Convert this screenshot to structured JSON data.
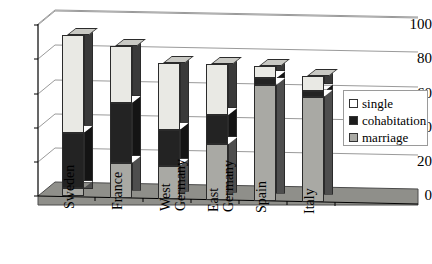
{
  "chart_data": {
    "type": "bar",
    "subtype": "stacked-column-3d",
    "title": "",
    "xlabel": "",
    "ylabel": "",
    "ylim": [
      0,
      100
    ],
    "yticks": [
      0,
      20,
      40,
      60,
      80,
      100
    ],
    "grid": true,
    "legend_position": "right",
    "categories": [
      "Sweden",
      "France",
      "West Germany",
      "East Germany",
      "Spain",
      "Italy"
    ],
    "series": [
      {
        "name": "marriage",
        "values": [
          5,
          20,
          19,
          32,
          67,
          61
        ]
      },
      {
        "name": "cohabitation",
        "values": [
          32,
          35,
          21,
          17,
          4,
          3
        ]
      },
      {
        "name": "single",
        "values": [
          57,
          33,
          39,
          30,
          7,
          9
        ]
      }
    ],
    "totals": [
      94,
      88,
      79,
      79,
      78,
      73
    ],
    "colors": {
      "single": "#e9e9e4",
      "cohabitation": "#232323",
      "marriage": "#a9a9a4",
      "axis": "#000000",
      "grid": "#9a9a9a",
      "floor": "#8f8f8a"
    }
  },
  "axis": {
    "y_ticks": [
      "100",
      "80",
      "60",
      "40",
      "20",
      "0"
    ]
  },
  "categories": [
    {
      "label": "Sweden",
      "lines": [
        "Sweden"
      ]
    },
    {
      "label": "France",
      "lines": [
        "France"
      ]
    },
    {
      "label": "West Germany",
      "lines": [
        "West",
        "Germany"
      ]
    },
    {
      "label": "East Germany",
      "lines": [
        "East",
        "Germany"
      ]
    },
    {
      "label": "Spain",
      "lines": [
        "Spain"
      ]
    },
    {
      "label": "Italy",
      "lines": [
        "Italy"
      ]
    }
  ],
  "legend": {
    "items": [
      {
        "label": "single",
        "key": "single"
      },
      {
        "label": "cohabitation",
        "key": "cohab"
      },
      {
        "label": "marriage",
        "key": "marr"
      }
    ]
  }
}
